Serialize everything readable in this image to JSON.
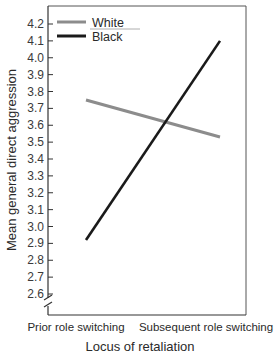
{
  "chart_data": {
    "type": "line",
    "title": "",
    "xlabel": "Locus of retaliation",
    "ylabel": "Mean general direct aggression",
    "categories": [
      "Prior role switching",
      "Subsequent role switching"
    ],
    "series": [
      {
        "name": "White",
        "color": "#8c8c8c",
        "values": [
          3.75,
          3.53
        ]
      },
      {
        "name": "Black",
        "color": "#1a1a1a",
        "values": [
          2.92,
          4.1
        ]
      }
    ],
    "ylim": [
      2.6,
      4.2
    ],
    "yticks": [
      "4.2",
      "4.1",
      "4.0",
      "3.9",
      "3.8",
      "3.7",
      "3.6",
      "3.5",
      "3.4",
      "3.3",
      "3.2",
      "3.1",
      "3.0",
      "2.9",
      "2.8",
      "2.7",
      "2.6"
    ],
    "axis_break": true,
    "grid": false,
    "legend_position": "upper-left-inside"
  }
}
